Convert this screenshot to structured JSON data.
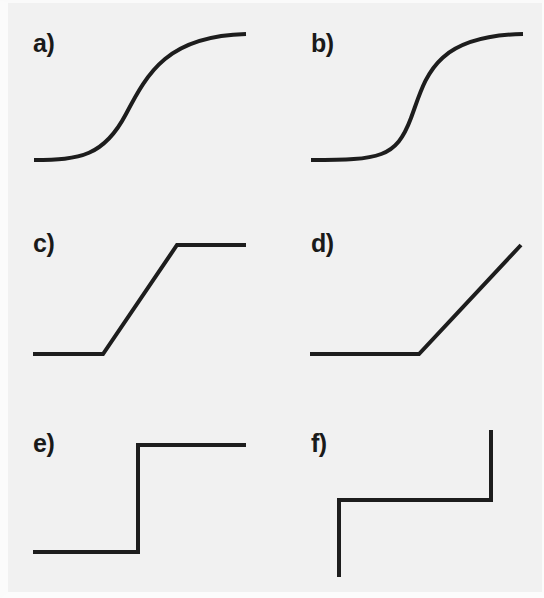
{
  "figure": {
    "background_color": "#f1f1f1",
    "stroke_color": "#1d1d1d",
    "stroke_width": 4,
    "width": 544,
    "height": 598,
    "grid": {
      "rows": 3,
      "cols": 2
    }
  },
  "chart_data": {
    "type": "line",
    "subtitle": "",
    "xlabel": "",
    "ylabel": "",
    "grid": false,
    "legend_position": "none",
    "axis_visible": false,
    "tick_labels": [],
    "panel_count": 6,
    "panels": [
      {
        "id": "a",
        "label": "a)",
        "label_x": 33,
        "label_y": 52,
        "name": "smooth-sigmoid",
        "description": "Smooth sigmoid / logistic curve with gentle slope",
        "xlim": [
          34,
          246
        ],
        "ylim": [
          34,
          160
        ],
        "x": [
          34,
          55,
          75,
          92,
          105,
          118,
          130,
          142,
          155,
          168,
          185,
          205,
          225,
          246
        ],
        "y": [
          160,
          159,
          157,
          152,
          144,
          130,
          112,
          90,
          68,
          52,
          42,
          37,
          35,
          34
        ],
        "path": "M 34 160 C 80 160 104 156 126 114 C 148 72 168 36 246 34"
      },
      {
        "id": "b",
        "label": "b)",
        "label_x": 311,
        "label_y": 52,
        "name": "steep-sigmoid",
        "description": "Steep sigmoid / logistic curve approaching a step",
        "xlim": [
          311,
          523
        ],
        "ylim": [
          34,
          160
        ],
        "x": [
          311,
          340,
          365,
          385,
          398,
          406,
          412,
          418,
          424,
          432,
          445,
          465,
          495,
          523
        ],
        "y": [
          160,
          160,
          159,
          154,
          142,
          120,
          97,
          74,
          55,
          43,
          37,
          35,
          34,
          34
        ],
        "path": "M 311 160 C 380 160 396 158 411 118 C 426 78 432 36 523 34"
      },
      {
        "id": "c",
        "label": "c)",
        "label_x": 33,
        "label_y": 252,
        "name": "saturating-linear",
        "description": "Piecewise-linear saturating ramp (hard sigmoid)",
        "xlim": [
          33,
          246
        ],
        "ylim": [
          245,
          354
        ],
        "breakpoints": [
          [
            33,
            354
          ],
          [
            103,
            354
          ],
          [
            177,
            245
          ],
          [
            246,
            245
          ]
        ],
        "path": "M 33 354 L 103 354 L 177 245 L 246 245"
      },
      {
        "id": "d",
        "label": "d)",
        "label_x": 311,
        "label_y": 252,
        "name": "rectifier-relu",
        "description": "Rectifier (ReLU): flat then linearly increasing",
        "xlim": [
          310,
          521
        ],
        "ylim": [
          245,
          354
        ],
        "breakpoints": [
          [
            310,
            354
          ],
          [
            419,
            354
          ],
          [
            521,
            245
          ]
        ],
        "path": "M 310 354 L 419 354 L 521 245"
      },
      {
        "id": "e",
        "label": "e)",
        "label_x": 33,
        "label_y": 452,
        "name": "heaviside-step",
        "description": "Heaviside / binary threshold step function",
        "xlim": [
          33,
          246
        ],
        "ylim": [
          445,
          552
        ],
        "breakpoints": [
          [
            33,
            552
          ],
          [
            138,
            552
          ],
          [
            138,
            445
          ],
          [
            246,
            445
          ]
        ],
        "path": "M 33 552 L 138 552 L 138 445 L 246 445"
      },
      {
        "id": "f",
        "label": "f)",
        "label_x": 311,
        "label_y": 452,
        "name": "staircase-multistep",
        "description": "Multi-level staircase with two vertical jumps",
        "xlim": [
          339,
          491
        ],
        "ylim": [
          430,
          577
        ],
        "breakpoints": [
          [
            339,
            577
          ],
          [
            339,
            500
          ],
          [
            491,
            500
          ],
          [
            491,
            430
          ]
        ],
        "path": "M 339 577 L 339 500 L 491 500 L 491 430"
      }
    ]
  }
}
